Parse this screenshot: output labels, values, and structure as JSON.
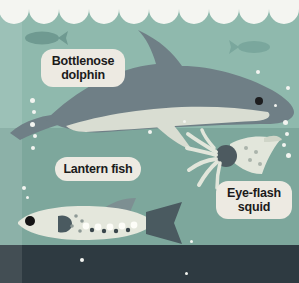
{
  "illustration": {
    "title": "Ocean layers with deep-sea creatures",
    "labels": [
      {
        "id": "dolphin",
        "line1": "Bottlenose",
        "line2": "dolphin"
      },
      {
        "id": "lantern",
        "line1": "Lantern fish",
        "line2": ""
      },
      {
        "id": "squid",
        "line1": "Eye-flash",
        "line2": "squid"
      }
    ],
    "creatures": [
      {
        "name": "bottlenose-dolphin",
        "label": "Bottlenose dolphin"
      },
      {
        "name": "lantern-fish",
        "label": "Lantern fish"
      },
      {
        "name": "eye-flash-squid",
        "label": "Eye-flash squid"
      },
      {
        "name": "silhouette-fish-left",
        "label": ""
      },
      {
        "name": "silhouette-fish-right",
        "label": ""
      }
    ],
    "colors": {
      "wave_foam": "#f4f5f1",
      "water_upper": "#8fb9ad",
      "water_mid": "#7da79c",
      "seafloor": "#2e3a41",
      "dolphin_body": "#6f7f86",
      "dolphin_belly": "#d9ddd2",
      "lantern_body": "#e4e7dc",
      "lantern_dark": "#4a5a60",
      "squid_body": "#e2e6db",
      "squid_eye": "#4d5a60",
      "label_bg": "#edeae2",
      "label_text": "#1b1b1b",
      "bubble": "#f2f4f0"
    }
  }
}
